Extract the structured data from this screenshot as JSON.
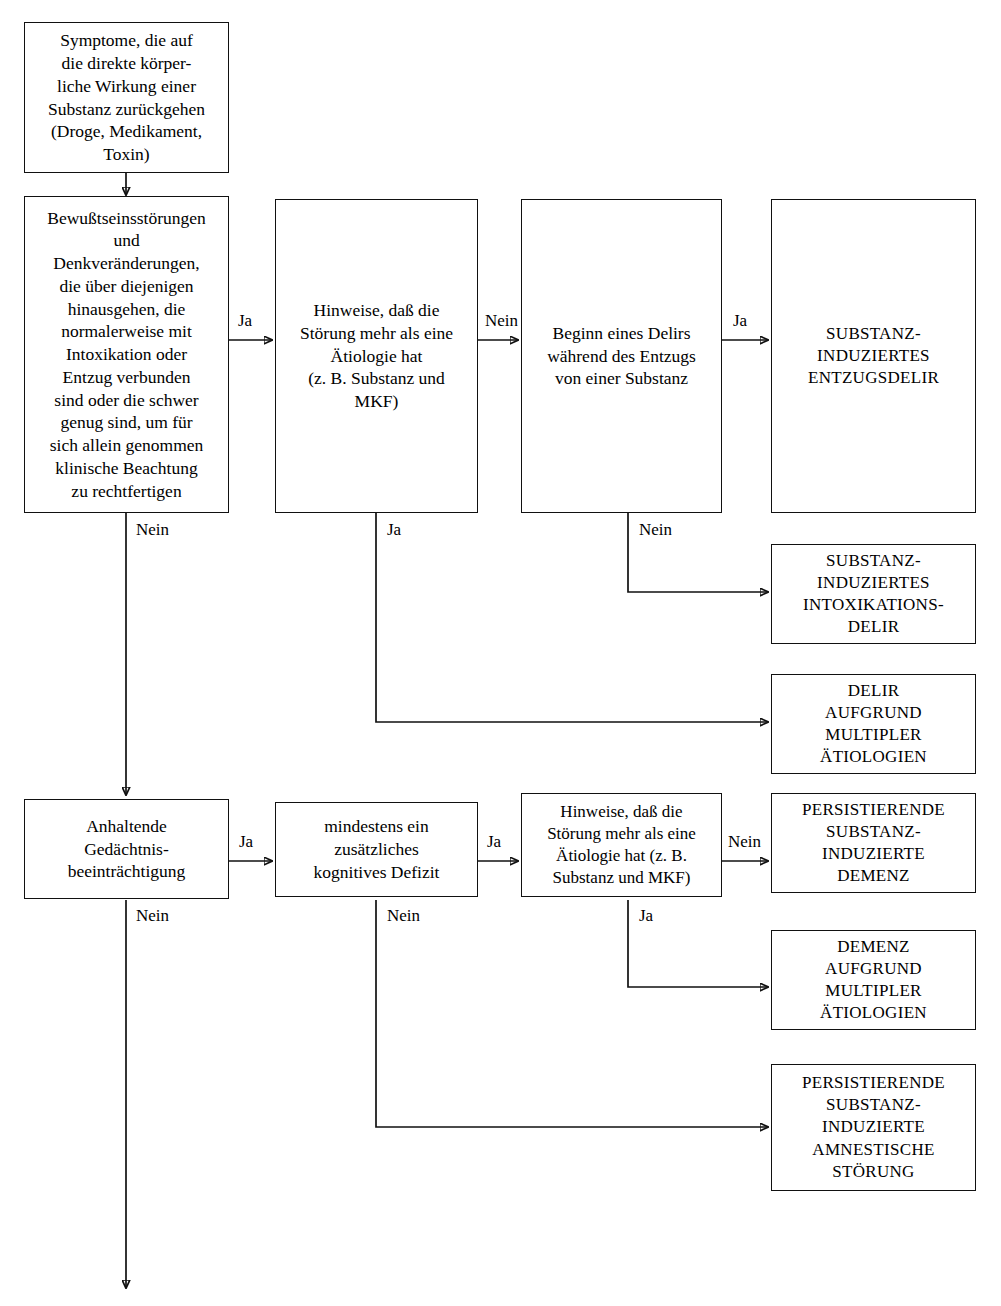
{
  "diagram": {
    "language": "de",
    "line_color": "#111111",
    "box_border_color": "#111111",
    "background": "#ffffff"
  },
  "nodes": {
    "symptome": "Symptome, die auf\ndie direkte körper-\nliche Wirkung einer\nSubstanz zurückgehen\n(Droge, Medikament,\nToxin)",
    "bewusstsein": "Bewußtseinsstörungen\nund\nDenkveränderungen,\ndie über diejenigen\nhinausgehen, die\nnormalerweise mit\nIntoxikation oder\nEntzug verbunden\nsind oder die schwer\ngenug sind, um für\nsich allein genommen\nklinische Beachtung\nzu rechtfertigen",
    "hinweise_delir": "Hinweise, daß die\nStörung mehr als eine\nÄtiologie hat\n(z. B. Substanz und\nMKF)",
    "beginn_delir": "Beginn eines Delirs\nwährend des Entzugs\nvon einer Substanz",
    "entzugsdelir": "SUBSTANZ-\nINDUZIERTES\nENTZUGSDELIR",
    "intoxikationsdelir": "SUBSTANZ-\nINDUZIERTES\nINTOXIKATIONS-\nDELIR",
    "delir_multipel": "DELIR\nAUFGRUND\nMULTIPLER\nÄTIOLOGIEN",
    "gedaechtnis": "Anhaltende\nGedächtnis-\nbeeinträchtigung",
    "kognitives_defizit": "mindestens ein\nzusätzliches\nkognitives Defizit",
    "hinweise_demenz": "Hinweise, daß die\nStörung mehr als eine\nÄtiologie hat (z. B.\nSubstanz und MKF)",
    "demenz_persistierend": "PERSISTIERENDE\nSUBSTANZ-\nINDUZIERTE\nDEMENZ",
    "demenz_multipel": "DEMENZ\nAUFGRUND\nMULTIPLER\nÄTIOLOGIEN",
    "amnestische_stoerung": "PERSISTIERENDE\nSUBSTANZ-\nINDUZIERTE\nAMNESTISCHE\nSTÖRUNG"
  },
  "edge_labels": {
    "bewusstsein_ja": "Ja",
    "bewusstsein_nein": "Nein",
    "hinweise_delir_nein": "Nein",
    "hinweise_delir_ja": "Ja",
    "beginn_delir_ja": "Ja",
    "beginn_delir_nein": "Nein",
    "gedaechtnis_ja": "Ja",
    "gedaechtnis_nein": "Nein",
    "kognitives_defizit_ja": "Ja",
    "kognitives_defizit_nein": "Nein",
    "hinweise_demenz_nein": "Nein",
    "hinweise_demenz_ja": "Ja"
  }
}
